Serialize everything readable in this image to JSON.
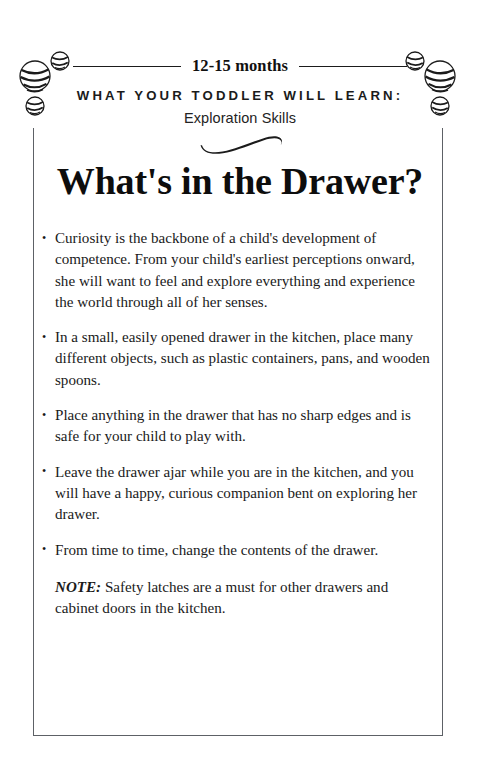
{
  "page": {
    "age_range": "12-15 months",
    "kicker": "WHAT YOUR TODDLER WILL LEARN:",
    "kicker_sub": "Exploration Skills",
    "title": "What's in the Drawer?",
    "ornament_left": "yarn-balls-ornament",
    "ornament_right": "yarn-balls-ornament",
    "swash": "swash-flourish-ornament",
    "rule_color": "#1b1b1b",
    "border_color": "#5d6166",
    "text_color": "#1a1a1a"
  },
  "body": {
    "bullets": [
      "Curiosity is the backbone of a child's development of competence. From your child's earliest perceptions onward, she will want to feel and explore everything and experience the world through all of her senses.",
      "In a small, easily opened drawer in the kitchen, place many differ­ent objects, such as plastic containers, pans, and wooden spoons.",
      "Place anything in the drawer that has no sharp edges and is safe for your child to play with.",
      "Leave the drawer ajar while you are in the kitchen, and you will have a happy, curious companion bent on exploring her drawer.",
      "From time to time, change the contents of the drawer."
    ],
    "note_label": "NOTE:",
    "note_text": " Safety latches are a must for other drawers and cabinet doors in the kitchen."
  }
}
